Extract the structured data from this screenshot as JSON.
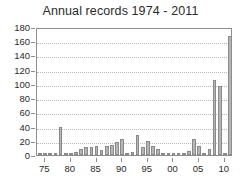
{
  "chart_data": {
    "type": "bar",
    "title": "Annual records 1974 - 2011",
    "xlabel": "",
    "ylabel": "",
    "ylim": [
      0,
      180
    ],
    "y_ticks": [
      0,
      20,
      40,
      60,
      80,
      100,
      120,
      140,
      160,
      180
    ],
    "y_tick_labels": [
      "0",
      "20",
      "40",
      "60",
      "80",
      "100",
      "120",
      "140",
      "160",
      "180"
    ],
    "x_tick_labels": [
      "75",
      "80",
      "85",
      "90",
      "95",
      "00",
      "05",
      "10"
    ],
    "x_tick_years": [
      1975,
      1980,
      1985,
      1990,
      1995,
      2000,
      2005,
      2010
    ],
    "xlim": [
      1973.4,
      2011.6
    ],
    "grid": true,
    "grid_axis": "y",
    "legend": "none",
    "bar_color": "#b5b5b5",
    "bar_edge_color": "#8a8a8a",
    "categories": [
      "1974",
      "1975",
      "1976",
      "1977",
      "1978",
      "1979",
      "1980",
      "1981",
      "1982",
      "1983",
      "1984",
      "1985",
      "1986",
      "1987",
      "1988",
      "1989",
      "1990",
      "1991",
      "1992",
      "1993",
      "1994",
      "1995",
      "1996",
      "1997",
      "1998",
      "1999",
      "2000",
      "2001",
      "2002",
      "2003",
      "2004",
      "2005",
      "2006",
      "2007",
      "2008",
      "2009",
      "2010",
      "2011"
    ],
    "values": [
      1,
      1,
      1,
      0,
      40,
      0,
      1,
      4,
      8,
      11,
      11,
      13,
      7,
      12,
      14,
      19,
      23,
      2,
      4,
      28,
      11,
      20,
      13,
      9,
      0,
      1,
      3,
      1,
      1,
      6,
      23,
      13,
      1,
      8,
      105,
      97,
      1,
      167
    ]
  }
}
